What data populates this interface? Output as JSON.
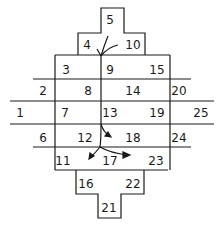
{
  "diagram": {
    "type": "numbered-grid-with-flow-arrows",
    "cells": [
      {
        "id": "1",
        "label": "1",
        "x": 20,
        "y": 117
      },
      {
        "id": "2",
        "label": "2",
        "x": 43,
        "y": 95
      },
      {
        "id": "3",
        "label": "3",
        "x": 66,
        "y": 74
      },
      {
        "id": "4",
        "label": "4",
        "x": 87,
        "y": 49
      },
      {
        "id": "5",
        "label": "5",
        "x": 110,
        "y": 24
      },
      {
        "id": "6",
        "label": "6",
        "x": 43,
        "y": 142
      },
      {
        "id": "7",
        "label": "7",
        "x": 65,
        "y": 117
      },
      {
        "id": "8",
        "label": "8",
        "x": 88,
        "y": 95
      },
      {
        "id": "9",
        "label": "9",
        "x": 110,
        "y": 74
      },
      {
        "id": "10",
        "label": "10",
        "x": 133,
        "y": 49
      },
      {
        "id": "11",
        "label": "11",
        "x": 63,
        "y": 165
      },
      {
        "id": "12",
        "label": "12",
        "x": 85,
        "y": 142
      },
      {
        "id": "13",
        "label": "13",
        "x": 110,
        "y": 117
      },
      {
        "id": "14",
        "label": "14",
        "x": 133,
        "y": 95
      },
      {
        "id": "15",
        "label": "15",
        "x": 157,
        "y": 74
      },
      {
        "id": "16",
        "label": "16",
        "x": 86,
        "y": 188
      },
      {
        "id": "17",
        "label": "17",
        "x": 110,
        "y": 165
      },
      {
        "id": "18",
        "label": "18",
        "x": 133,
        "y": 142
      },
      {
        "id": "19",
        "label": "19",
        "x": 157,
        "y": 117
      },
      {
        "id": "20",
        "label": "20",
        "x": 179,
        "y": 95
      },
      {
        "id": "21",
        "label": "21",
        "x": 109,
        "y": 212
      },
      {
        "id": "22",
        "label": "22",
        "x": 133,
        "y": 188
      },
      {
        "id": "23",
        "label": "23",
        "x": 156,
        "y": 165
      },
      {
        "id": "24",
        "label": "24",
        "x": 179,
        "y": 142
      },
      {
        "id": "25",
        "label": "25",
        "x": 201,
        "y": 117
      }
    ],
    "arrows": [
      {
        "name": "arrow-from-5-to-center",
        "from": "5",
        "to": "9"
      },
      {
        "name": "arrow-from-10-to-center",
        "from": "10",
        "to": "9"
      },
      {
        "name": "arrow-center-to-18",
        "from": "13",
        "to": "18"
      },
      {
        "name": "arrow-center-to-11",
        "from": "12",
        "to": "11"
      },
      {
        "name": "arrow-center-to-17",
        "from": "12",
        "to": "23"
      }
    ],
    "colors": {
      "line": "#1a1a1a",
      "background": "#ffffff"
    }
  }
}
